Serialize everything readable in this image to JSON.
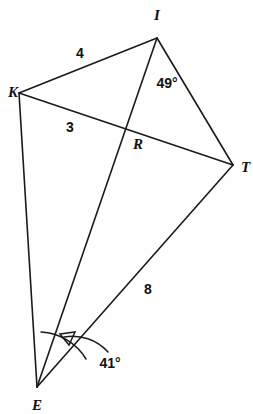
{
  "figure": {
    "background_color": "#fefefe",
    "stroke_color": "#1a1a1a",
    "vertices": [
      {
        "name": "I",
        "label": "I",
        "x": 157,
        "y": 38,
        "label_x": 157,
        "label_y": 20
      },
      {
        "name": "K",
        "label": "K",
        "x": 19,
        "y": 93,
        "label_x": 8,
        "label_y": 97
      },
      {
        "name": "T",
        "label": "T",
        "x": 233,
        "y": 165,
        "label_x": 243,
        "label_y": 172
      },
      {
        "name": "R",
        "label": "R",
        "x": 128,
        "y": 131,
        "label_x": 134,
        "label_y": 149
      },
      {
        "name": "E",
        "label": "E",
        "x": 37,
        "y": 387,
        "label_x": 38,
        "label_y": 409
      }
    ],
    "segments": [
      {
        "name": "segment-K-I",
        "from": "K",
        "to": "I"
      },
      {
        "name": "segment-I-T",
        "from": "I",
        "to": "T"
      },
      {
        "name": "segment-K-T",
        "from": "K",
        "to": "T"
      },
      {
        "name": "segment-I-E",
        "from": "I",
        "to": "E"
      },
      {
        "name": "segment-K-E",
        "from": "K",
        "to": "E"
      },
      {
        "name": "segment-E-T",
        "from": "E",
        "to": "T"
      }
    ],
    "measure_labels": [
      {
        "name": "length-KI",
        "text": "4",
        "x": 80,
        "y": 58,
        "segment": "segment-K-I"
      },
      {
        "name": "length-KR",
        "text": "3",
        "x": 70,
        "y": 132,
        "segment": "segment-K-T"
      },
      {
        "name": "length-ET",
        "text": "8",
        "x": 148,
        "y": 294,
        "segment": "segment-E-T"
      }
    ],
    "angle_labels": [
      {
        "name": "angle-at-I",
        "text": "49°",
        "x": 167,
        "y": 88,
        "vertex": "I"
      },
      {
        "name": "angle-at-E",
        "text": "41°",
        "x": 110,
        "y": 368,
        "vertex": "E"
      }
    ],
    "angle_marks": [
      {
        "name": "angle-arc-E-small",
        "vertex": "E",
        "type": "arc"
      },
      {
        "name": "angle-arrow-E",
        "vertex": "E",
        "type": "curved-arrow"
      }
    ]
  }
}
